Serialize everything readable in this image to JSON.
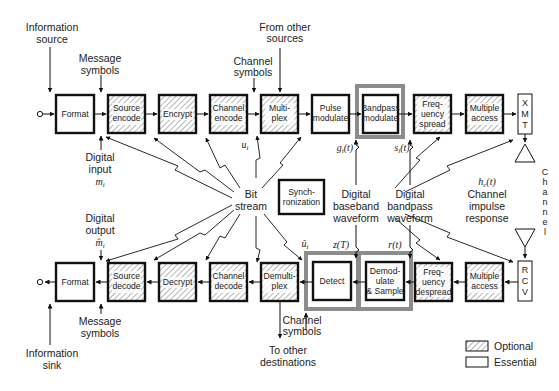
{
  "diagram": {
    "transmit_chain": {
      "blocks": [
        {
          "id": "format",
          "lines": [
            "Format"
          ],
          "type": "essential"
        },
        {
          "id": "source-encode",
          "lines": [
            "Source",
            "encode"
          ],
          "type": "optional"
        },
        {
          "id": "encrypt",
          "lines": [
            "Encrypt"
          ],
          "type": "optional"
        },
        {
          "id": "channel-encode",
          "lines": [
            "Channel",
            "encode"
          ],
          "type": "optional"
        },
        {
          "id": "multiplex",
          "lines": [
            "Multi-",
            "plex"
          ],
          "type": "optional"
        },
        {
          "id": "pulse-modulate",
          "lines": [
            "Pulse",
            "modulate"
          ],
          "type": "essential"
        },
        {
          "id": "bandpass-modulate",
          "lines": [
            "Bandpass",
            "modulate"
          ],
          "type": "essential"
        },
        {
          "id": "frequency-spread",
          "lines": [
            "Freq-",
            "uency",
            "spread"
          ],
          "type": "optional"
        },
        {
          "id": "multiple-access",
          "lines": [
            "Multiple",
            "access"
          ],
          "type": "optional"
        }
      ],
      "xmt": [
        "X",
        "M",
        "T"
      ]
    },
    "receive_chain": {
      "blocks": [
        {
          "id": "format",
          "lines": [
            "Format"
          ],
          "type": "essential"
        },
        {
          "id": "source-decode",
          "lines": [
            "Source",
            "decode"
          ],
          "type": "optional"
        },
        {
          "id": "decrypt",
          "lines": [
            "Decrypt"
          ],
          "type": "optional"
        },
        {
          "id": "channel-decode",
          "lines": [
            "Channel",
            "decode"
          ],
          "type": "optional"
        },
        {
          "id": "demultiplex",
          "lines": [
            "Demulti-",
            "plex"
          ],
          "type": "optional"
        },
        {
          "id": "detect",
          "lines": [
            "Detect"
          ],
          "type": "essential"
        },
        {
          "id": "demodulate-sample",
          "lines": [
            "Demod-",
            "ulate",
            "& Sample"
          ],
          "type": "essential"
        },
        {
          "id": "frequency-despread",
          "lines": [
            "Freq-",
            "uency",
            "despread"
          ],
          "type": "optional"
        },
        {
          "id": "multiple-access",
          "lines": [
            "Multiple",
            "access"
          ],
          "type": "optional"
        }
      ],
      "rcv": [
        "R",
        "C",
        "V"
      ]
    },
    "sync_block": [
      "Synch-",
      "ronization"
    ],
    "channel_vertical": [
      "C",
      "h",
      "a",
      "n",
      "n",
      "e",
      "l"
    ],
    "labels": {
      "info_source": [
        "Information",
        "source"
      ],
      "msg_symbols_top": [
        "Message",
        "symbols"
      ],
      "channel_symbols_top": [
        "Channel",
        "symbols"
      ],
      "from_other_sources": [
        "From other",
        "sources"
      ],
      "digital_input": [
        "Digital",
        "input"
      ],
      "m_i": "m",
      "m_i_sub": "i",
      "u_i": "u",
      "u_i_sub": "i",
      "g_i": "g",
      "g_i_sub": "i",
      "g_i_arg": "(t)",
      "s_i": "s",
      "s_i_sub": "i",
      "s_i_arg": "(t)",
      "bit_stream": [
        "Bit",
        "stream"
      ],
      "digital_baseband": [
        "Digital",
        "baseband",
        "waveform"
      ],
      "digital_bandpass": [
        "Digital",
        "bandpass",
        "waveform"
      ],
      "h_c": "h",
      "h_c_sub": "c",
      "h_c_arg": "(t)",
      "channel_impulse": [
        "Channel",
        "impulse",
        "response"
      ],
      "digital_output": [
        "Digital",
        "output"
      ],
      "m_hat_i": "m̂",
      "m_hat_i_sub": "i",
      "u_hat_i": "û",
      "u_hat_i_sub": "i",
      "z_T": "z(T)",
      "r_t": "r(t)",
      "msg_symbols_bottom": [
        "Message",
        "symbols"
      ],
      "info_sink": [
        "Information",
        "sink"
      ],
      "channel_symbols_bottom": [
        "Channel",
        "symbols"
      ],
      "to_other_destinations": [
        "To other",
        "destinations"
      ]
    },
    "legend": [
      {
        "label": "Optional",
        "style": "hatched"
      },
      {
        "label": "Essential",
        "style": "plain"
      }
    ],
    "colors": {
      "line": "#111111",
      "highlight_frame": "#8c8c8c",
      "hatch": "#777777"
    }
  }
}
